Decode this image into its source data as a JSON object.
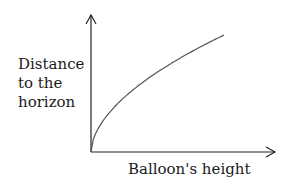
{
  "chart_data": {
    "type": "line",
    "title": "",
    "xlabel": "Balloon's height",
    "ylabel": "Distance to the horizon",
    "ylabel_lines": [
      "Distance",
      "to the",
      "horizon"
    ],
    "x": [
      0,
      0.1,
      0.2,
      0.3,
      0.4,
      0.5,
      0.6,
      0.7,
      0.8,
      0.9,
      1.0
    ],
    "series": [
      {
        "name": "Distance to the horizon",
        "values": [
          0,
          0.32,
          0.45,
          0.55,
          0.63,
          0.71,
          0.77,
          0.84,
          0.89,
          0.95,
          1.0
        ]
      }
    ],
    "shape": "concave increasing (square-root-like)",
    "ticks": "none",
    "grid": false,
    "legend": "none",
    "colors": {
      "axes": "#222222",
      "curve": "#555555"
    }
  }
}
